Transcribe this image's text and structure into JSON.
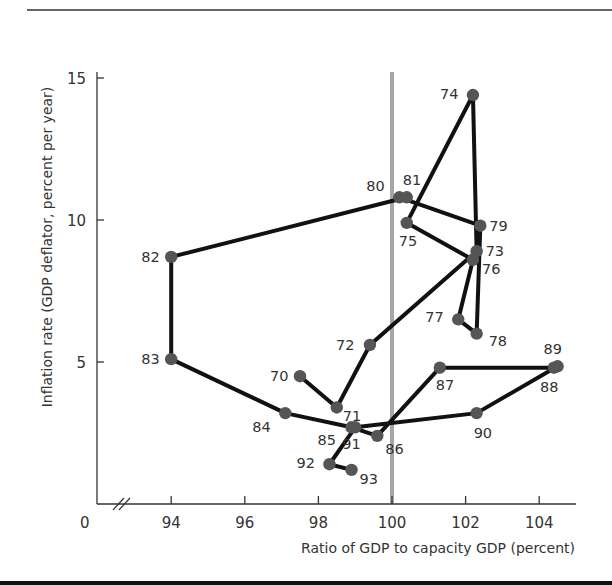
{
  "chart_data": {
    "type": "scatter",
    "subtype": "connected-scatter",
    "title": "",
    "xlabel": "Ratio of GDP to capacity GDP (percent)",
    "ylabel": "Inflation rate (GDP deflator, percent per year)",
    "xlim": [
      93,
      105
    ],
    "ylim": [
      0,
      16
    ],
    "x_ticks": [
      94,
      96,
      98,
      100,
      102,
      104
    ],
    "y_ticks": [
      5,
      10,
      15
    ],
    "origin_label": "0",
    "axis_break": true,
    "reference_line": {
      "axis": "x",
      "value": 100,
      "color": "#a6a6a6"
    },
    "grid": false,
    "legend": null,
    "points": [
      {
        "label": "70",
        "x": 97.5,
        "y": 4.5
      },
      {
        "label": "71",
        "x": 98.5,
        "y": 3.4
      },
      {
        "label": "72",
        "x": 99.4,
        "y": 5.6
      },
      {
        "label": "73",
        "x": 102.3,
        "y": 8.9
      },
      {
        "label": "74",
        "x": 102.2,
        "y": 14.4
      },
      {
        "label": "75",
        "x": 100.4,
        "y": 9.9
      },
      {
        "label": "76",
        "x": 102.2,
        "y": 8.6
      },
      {
        "label": "77",
        "x": 101.8,
        "y": 6.5
      },
      {
        "label": "78",
        "x": 102.3,
        "y": 6.0
      },
      {
        "label": "79",
        "x": 102.4,
        "y": 9.8
      },
      {
        "label": "80",
        "x": 100.2,
        "y": 10.8
      },
      {
        "label": "81",
        "x": 100.4,
        "y": 10.8
      },
      {
        "label": "82",
        "x": 94.0,
        "y": 8.7
      },
      {
        "label": "83",
        "x": 94.0,
        "y": 5.1
      },
      {
        "label": "84",
        "x": 97.1,
        "y": 3.2
      },
      {
        "label": "85",
        "x": 98.9,
        "y": 2.7
      },
      {
        "label": "86",
        "x": 99.6,
        "y": 2.4
      },
      {
        "label": "87",
        "x": 101.3,
        "y": 4.8
      },
      {
        "label": "88",
        "x": 104.4,
        "y": 4.8
      },
      {
        "label": "89",
        "x": 104.5,
        "y": 4.85
      },
      {
        "label": "90",
        "x": 102.3,
        "y": 3.2
      },
      {
        "label": "91",
        "x": 99.0,
        "y": 2.7
      },
      {
        "label": "92",
        "x": 98.3,
        "y": 1.4
      },
      {
        "label": "93",
        "x": 98.9,
        "y": 1.2
      }
    ],
    "label_offsets": {
      "70": [
        -30,
        5
      ],
      "71": [
        6,
        14
      ],
      "72": [
        -34,
        5
      ],
      "73": [
        9,
        5
      ],
      "74": [
        -33,
        4
      ],
      "75": [
        -8,
        23
      ],
      "76": [
        9,
        14
      ],
      "77": [
        -33,
        3
      ],
      "78": [
        12,
        12
      ],
      "79": [
        9,
        5
      ],
      "80": [
        -33,
        -6
      ],
      "81": [
        -4,
        -12
      ],
      "82": [
        -30,
        5
      ],
      "83": [
        -30,
        5
      ],
      "84": [
        -33,
        19
      ],
      "85": [
        -34,
        18
      ],
      "86": [
        8,
        18
      ],
      "87": [
        -4,
        22
      ],
      "88": [
        -14,
        24
      ],
      "89": [
        -14,
        -12
      ],
      "90": [
        -3,
        25
      ],
      "91": [
        -13,
        22
      ],
      "92": [
        -33,
        4
      ],
      "93": [
        8,
        14
      ]
    }
  },
  "layout": {
    "plot_px": {
      "x0": 97,
      "y0": 504,
      "x100": 392,
      "px_per_x": 36.8,
      "px_per_y": 28.4,
      "x_end": 576,
      "y_top": 72
    }
  }
}
